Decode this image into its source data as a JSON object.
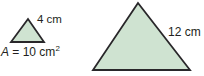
{
  "figure": {
    "colors": {
      "triangle_fill": "#cfe3d1",
      "triangle_stroke": "#29272a",
      "text": "#231f20",
      "background": "#ffffff"
    },
    "small_triangle": {
      "side_label": "4 cm",
      "area_label": {
        "variable": "A",
        "rest": " = 10 cm",
        "exponent": "2"
      }
    },
    "large_triangle": {
      "side_label": "12 cm"
    }
  }
}
